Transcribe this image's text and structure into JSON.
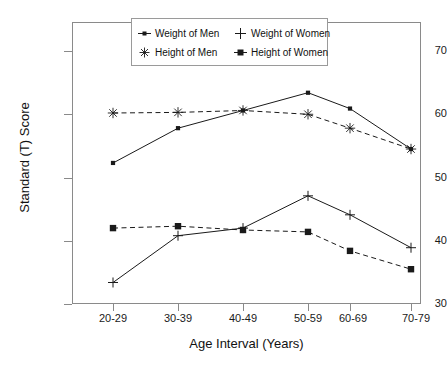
{
  "chart_data": {
    "type": "line",
    "title": "",
    "xlabel": "Age Interval (Years)",
    "ylabel": "Standard (T) Score",
    "categories": [
      "20-29",
      "30-39",
      "40-49",
      "50-59",
      "60-69",
      "70-79"
    ],
    "ylim": [
      30,
      73
    ],
    "yticks": [
      30,
      40,
      50,
      60,
      70
    ],
    "grid": false,
    "legend_position": "top-center",
    "series": [
      {
        "name": "Weight of Men",
        "marker": "filled-square-small",
        "linestyle": "solid",
        "color": "#1a1a1a",
        "values": [
          52.3,
          57.8,
          60.6,
          63.4,
          60.9,
          54.5
        ]
      },
      {
        "name": "Weight of Women",
        "marker": "plus",
        "linestyle": "solid",
        "color": "#1a1a1a",
        "values": [
          33.4,
          40.8,
          42.0,
          47.1,
          44.1,
          38.9
        ]
      },
      {
        "name": "Height of Men",
        "marker": "asterisk",
        "linestyle": "dashed",
        "color": "#1a1a1a",
        "values": [
          60.2,
          60.3,
          60.6,
          60.0,
          57.8,
          54.5
        ]
      },
      {
        "name": "Height of Women",
        "marker": "filled-square",
        "linestyle": "dashed",
        "color": "#1a1a1a",
        "values": [
          42.0,
          42.3,
          41.7,
          41.4,
          38.4,
          35.5
        ]
      }
    ]
  },
  "axes": {
    "y_tick_labels": [
      "70",
      "60",
      "50",
      "40",
      "30"
    ],
    "x_tick_labels": [
      "20-29",
      "30-39",
      "40-49",
      "50-59",
      "60-69",
      "70-79"
    ],
    "y_title": "Standard (T) Score",
    "x_title": "Age Interval (Years)"
  },
  "legend": {
    "items": [
      {
        "label": "Weight of Men",
        "marker": "filled-square-small"
      },
      {
        "label": "Weight of Women",
        "marker": "plus"
      },
      {
        "label": "Height of Men",
        "marker": "asterisk"
      },
      {
        "label": "Height of Women",
        "marker": "filled-square"
      }
    ]
  }
}
